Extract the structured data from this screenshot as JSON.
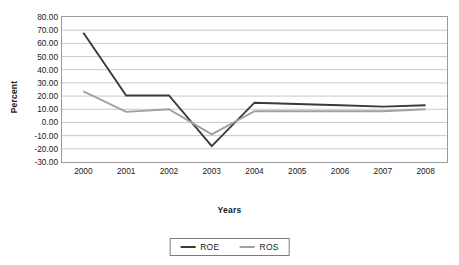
{
  "chart_data": {
    "type": "line",
    "title": "",
    "xlabel": "Years",
    "ylabel": "Percent",
    "categories": [
      "2000",
      "2001",
      "2002",
      "2003",
      "2004",
      "2005",
      "2006",
      "2007",
      "2008"
    ],
    "ylim": [
      -30,
      80
    ],
    "ytick_step": 10,
    "ytick_labels": [
      "80.00",
      "70.00",
      "60.00",
      "50.00",
      "40.00",
      "30.00",
      "20.00",
      "10.00",
      "0.00",
      "-10.00",
      "-20.00",
      "-30.00"
    ],
    "ytick_values": [
      80,
      70,
      60,
      50,
      40,
      30,
      20,
      10,
      0,
      -10,
      -20,
      -30
    ],
    "grid": true,
    "grid_axis": "y",
    "legend_position": "bottom",
    "series": [
      {
        "name": "ROE",
        "color": "#3a3a3a",
        "values": [
          68.0,
          20.5,
          20.5,
          -18.0,
          15.0,
          14.0,
          13.0,
          12.0,
          13.0
        ]
      },
      {
        "name": "ROS",
        "color": "#a0a0a0",
        "values": [
          23.5,
          8.0,
          10.0,
          -9.0,
          8.5,
          8.5,
          8.5,
          8.5,
          10.0
        ]
      }
    ]
  },
  "colors": {
    "roe": "#3a3a3a",
    "ros": "#a0a0a0",
    "grid": "#c9c9c9",
    "frame": "#9a9a9a",
    "text": "#1a1a1a",
    "background": "#ffffff"
  },
  "legend": {
    "items": [
      {
        "label": "ROE",
        "color": "#3a3a3a"
      },
      {
        "label": "ROS",
        "color": "#a0a0a0"
      }
    ]
  }
}
